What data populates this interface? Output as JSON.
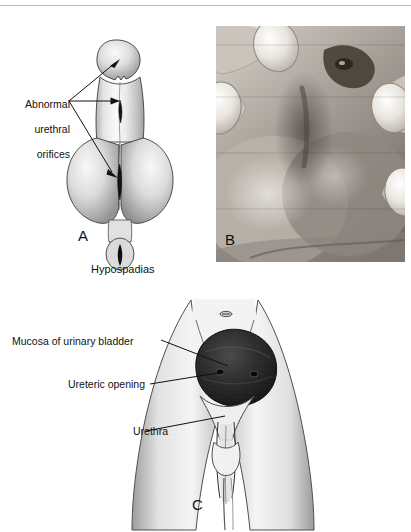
{
  "figure": {
    "panels": [
      {
        "id": "A",
        "letter": "A",
        "caption": "Hypospadias",
        "type": "line-drawing",
        "labels": [
          {
            "name": "abnormal-urethral-orifices",
            "lines": [
              "Abnormal",
              "urethral",
              "orifices"
            ],
            "text": "Abnormal urethral orifices",
            "leader_count": 3
          }
        ]
      },
      {
        "id": "B",
        "letter": "B",
        "caption": "",
        "type": "clinical-photograph",
        "labels": []
      },
      {
        "id": "C",
        "letter": "C",
        "caption": "",
        "type": "line-drawing",
        "labels": [
          {
            "name": "mucosa-of-urinary-bladder",
            "text": "Mucosa of urinary bladder"
          },
          {
            "name": "ureteric-opening",
            "text": "Ureteric opening"
          },
          {
            "name": "urethra",
            "text": "Urethra"
          }
        ]
      }
    ]
  },
  "colors": {
    "ink": "#111111",
    "rule": "#b9b9b9",
    "paper": "#ffffff",
    "stipple": "#8a8a8a",
    "bladder_mass": "#2b2b2b",
    "photo_light": "#e8e6e3",
    "photo_mid": "#9a948e",
    "photo_dark": "#3b3834"
  }
}
